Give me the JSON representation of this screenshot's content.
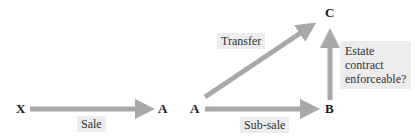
{
  "nodes": {
    "x": "X",
    "a1": "A",
    "a2": "A",
    "b": "B",
    "c": "C"
  },
  "labels": {
    "sale": "Sale",
    "transfer": "Transfer",
    "sub_sale": "Sub-sale",
    "estate_line1": "Estate",
    "estate_line2": "contract",
    "estate_line3": "enforceable?"
  },
  "colors": {
    "arrow": "#a8a8a8",
    "label_bg": "#ececec"
  }
}
